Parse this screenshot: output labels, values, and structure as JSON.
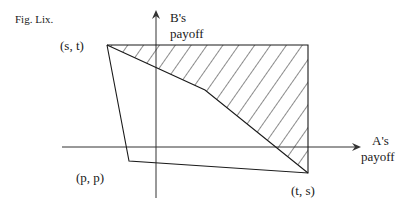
{
  "figure": {
    "caption": "Fig. Lix.",
    "y_axis_label_line1": "B's",
    "y_axis_label_line2": "payoff",
    "x_axis_label_line1": "A's",
    "x_axis_label_line2": "payoff",
    "points": {
      "st": "(s, t)",
      "pp": "(p, p)",
      "ts": "(t, s)"
    },
    "colors": {
      "line": "#1a1a1a",
      "axis": "#333333",
      "background": "#ffffff"
    }
  }
}
